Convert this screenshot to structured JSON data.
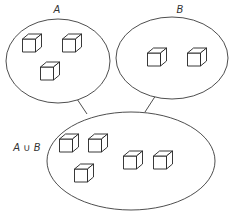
{
  "diagram": {
    "type": "set-union-venn",
    "sets": [
      {
        "id": "A",
        "label": "A",
        "ellipse": {
          "cx": 58,
          "cy": 61,
          "rx": 52,
          "ry": 42
        },
        "label_pos": {
          "x": 57,
          "y": 13
        },
        "elements": [
          {
            "x": 32,
            "y": 43
          },
          {
            "x": 72,
            "y": 43
          },
          {
            "x": 50,
            "y": 71
          }
        ]
      },
      {
        "id": "B",
        "label": "B",
        "ellipse": {
          "cx": 172,
          "cy": 58,
          "rx": 56,
          "ry": 41
        },
        "label_pos": {
          "x": 180,
          "y": 13
        },
        "elements": [
          {
            "x": 157,
            "y": 57
          },
          {
            "x": 197,
            "y": 57
          }
        ]
      },
      {
        "id": "AuB",
        "label": "A ∪ B",
        "ellipse": {
          "cx": 131,
          "cy": 161,
          "rx": 84,
          "ry": 49
        },
        "label_pos": {
          "x": 27,
          "y": 151
        },
        "elements": [
          {
            "x": 69,
            "y": 143
          },
          {
            "x": 98,
            "y": 143
          },
          {
            "x": 84,
            "y": 173
          },
          {
            "x": 133,
            "y": 160
          },
          {
            "x": 163,
            "y": 160
          }
        ]
      }
    ],
    "connectors": [
      {
        "from": "A",
        "to": "AuB",
        "x1": 77,
        "y1": 99,
        "x2": 87,
        "y2": 114
      },
      {
        "from": "B",
        "to": "AuB",
        "x1": 156,
        "y1": 95,
        "x2": 145,
        "y2": 112
      }
    ],
    "element_icon": "cube-icon",
    "colors": {
      "stroke": "#3a3a3a",
      "background": "#ffffff"
    }
  }
}
